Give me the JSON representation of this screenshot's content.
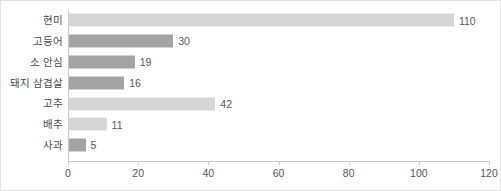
{
  "chart_data": {
    "type": "bar",
    "orientation": "horizontal",
    "title": "",
    "xlabel": "",
    "ylabel": "",
    "categories": [
      "현미",
      "고등어",
      "소 안심",
      "돼지 삼겹살",
      "고추",
      "배추",
      "사과"
    ],
    "values": [
      110,
      30,
      19,
      16,
      42,
      11,
      5
    ],
    "value_labels": [
      "110",
      "30",
      "19",
      "16",
      "42",
      "11",
      "5"
    ],
    "bar_colors": [
      "#d6d6d6",
      "#a3a3a3",
      "#a3a3a3",
      "#a3a3a3",
      "#d6d6d6",
      "#d6d6d6",
      "#a3a3a3"
    ],
    "xlim": [
      0,
      120
    ],
    "xticks": [
      0,
      20,
      40,
      60,
      80,
      100,
      120
    ],
    "xtick_labels": [
      "0",
      "20",
      "40",
      "60",
      "80",
      "100",
      "120"
    ],
    "grid": false,
    "legend": null,
    "axis_color": "#c8c8c8",
    "text_color": "#4a4a4a",
    "border_color": "#e2e2e2",
    "background": "#ffffff"
  }
}
